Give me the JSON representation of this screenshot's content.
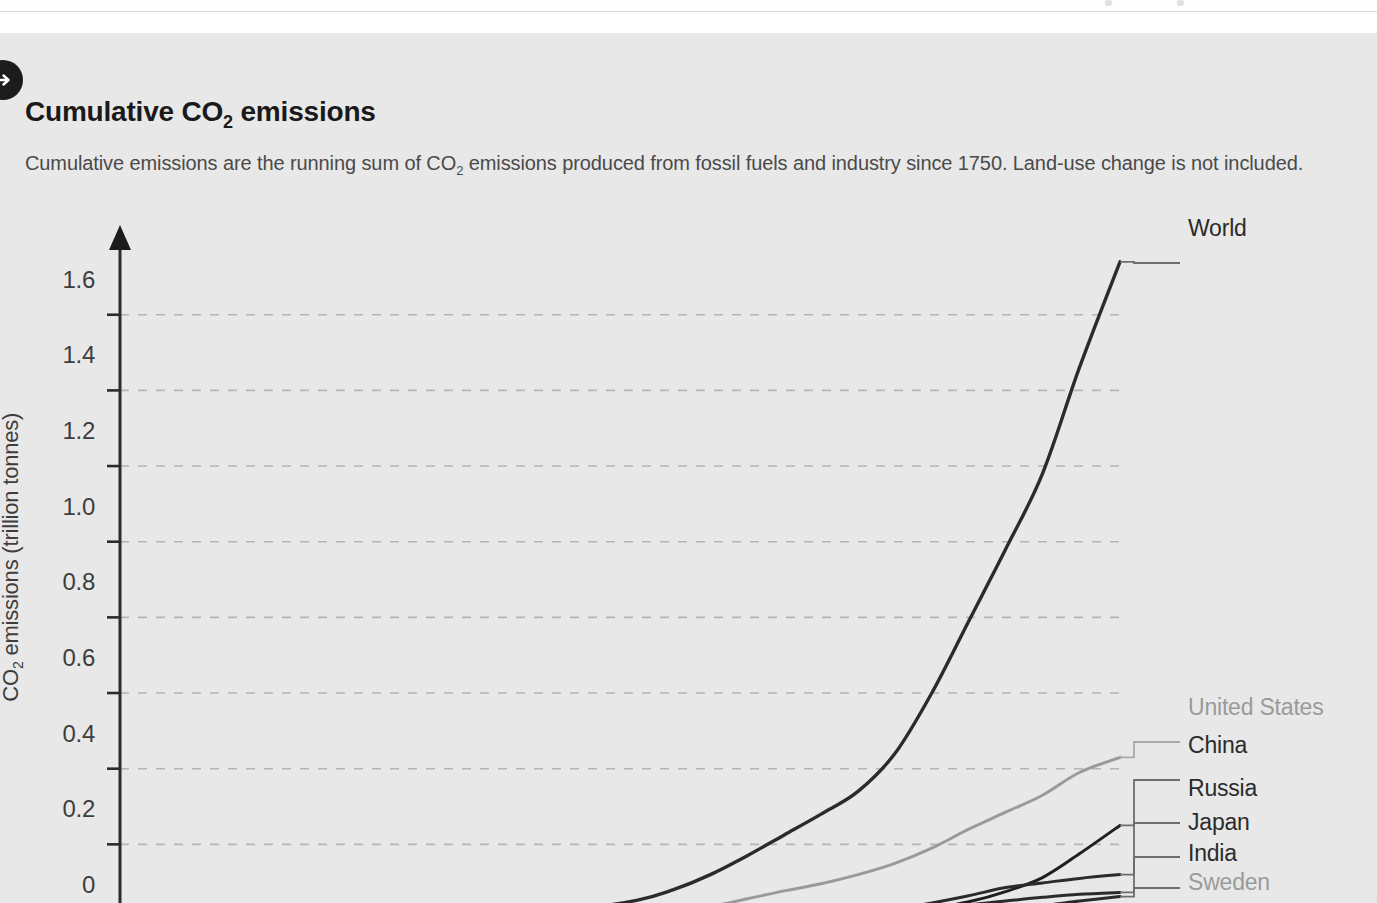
{
  "header": {
    "title_main": "Cumulative CO",
    "title_sub": "2",
    "title_tail": " emissions",
    "subtitle_a": "Cumulative emissions are the running sum of CO",
    "subtitle_sub": "2",
    "subtitle_b": " emissions produced from fossil fuels and industry since 1750. Land-use change is not included.",
    "badge_icon": "arrow-right-circle-icon"
  },
  "colors": {
    "card_bg": "#e8e8e8",
    "page_bg": "#ffffff",
    "axis": "#2b2b2b",
    "grid": "#b4b4b4",
    "world": "#2b2b2b",
    "united_states": "#9a9a9a",
    "china": "#1f1f1f",
    "russia": "#2b2b2b",
    "japan": "#2b2b2b",
    "india": "#2b2b2b",
    "sweden": "#b0b0b0",
    "text": "#3d3d3d",
    "title": "#1a1a1a"
  },
  "chart_data": {
    "type": "line",
    "title": "Cumulative CO2 emissions",
    "subtitle": "Cumulative emissions are the running sum of CO2 emissions produced from fossil fuels and industry since 1750. Land-use change is not included.",
    "xlabel": "",
    "ylabel": "CO₂ emissions (trillion tonnes)",
    "ylim": [
      0,
      1.75
    ],
    "xlim": [
      1750,
      2021
    ],
    "grid": "horizontal-dashed",
    "legend_position": "right-end-labels",
    "yticks": [
      "0",
      "0.2",
      "0.4",
      "0.6",
      "0.8",
      "1.0",
      "1.2",
      "1.4",
      "1.6"
    ],
    "ytick_values": [
      0,
      0.2,
      0.4,
      0.6,
      0.8,
      1.0,
      1.2,
      1.4,
      1.6
    ],
    "xticks": [
      1750,
      1800,
      1850,
      1900,
      1950,
      2000
    ],
    "x": [
      1750,
      1800,
      1830,
      1850,
      1870,
      1890,
      1900,
      1910,
      1920,
      1930,
      1940,
      1950,
      1960,
      1970,
      1980,
      1990,
      2000,
      2010,
      2021
    ],
    "series": [
      {
        "name": "World",
        "color": "#2b2b2b",
        "end_value": 1.74,
        "values": [
          0.0,
          0.002,
          0.006,
          0.012,
          0.024,
          0.052,
          0.08,
          0.12,
          0.17,
          0.225,
          0.28,
          0.34,
          0.44,
          0.6,
          0.79,
          0.98,
          1.18,
          1.46,
          1.74
        ]
      },
      {
        "name": "United States",
        "color": "#9a9a9a",
        "end_value": 0.43,
        "values": [
          0.0,
          0.0,
          0.0,
          0.001,
          0.003,
          0.011,
          0.02,
          0.035,
          0.056,
          0.077,
          0.096,
          0.12,
          0.15,
          0.19,
          0.24,
          0.285,
          0.33,
          0.39,
          0.43
        ]
      },
      {
        "name": "China",
        "color": "#1f1f1f",
        "end_value": 0.25,
        "values": [
          0.0,
          0.0,
          0.0,
          0.0,
          0.0,
          0.001,
          0.001,
          0.002,
          0.004,
          0.006,
          0.009,
          0.012,
          0.02,
          0.031,
          0.048,
          0.075,
          0.112,
          0.175,
          0.25
        ]
      },
      {
        "name": "Russia",
        "color": "#2b2b2b",
        "end_value": 0.12,
        "values": [
          0.0,
          0.0,
          0.0,
          0.0,
          0.0,
          0.001,
          0.002,
          0.004,
          0.006,
          0.009,
          0.014,
          0.019,
          0.029,
          0.045,
          0.064,
          0.086,
          0.098,
          0.11,
          0.12
        ]
      },
      {
        "name": "Japan",
        "color": "#2b2b2b",
        "end_value": 0.073,
        "values": [
          0.0,
          0.0,
          0.0,
          0.0,
          0.0,
          0.0,
          0.001,
          0.002,
          0.004,
          0.007,
          0.011,
          0.014,
          0.019,
          0.029,
          0.04,
          0.05,
          0.06,
          0.068,
          0.073
        ]
      },
      {
        "name": "India",
        "color": "#2b2b2b",
        "end_value": 0.062,
        "values": [
          0.0,
          0.0,
          0.0,
          0.0,
          0.0,
          0.001,
          0.001,
          0.002,
          0.003,
          0.005,
          0.007,
          0.009,
          0.012,
          0.016,
          0.022,
          0.03,
          0.038,
          0.05,
          0.062
        ]
      },
      {
        "name": "Sweden",
        "color": "#b0b0b0",
        "end_value": 0.006,
        "values": [
          0.0,
          0.0,
          0.0,
          0.0,
          0.0,
          0.0,
          0.001,
          0.001,
          0.001,
          0.002,
          0.002,
          0.003,
          0.003,
          0.004,
          0.005,
          0.005,
          0.006,
          0.006,
          0.006
        ]
      }
    ]
  }
}
